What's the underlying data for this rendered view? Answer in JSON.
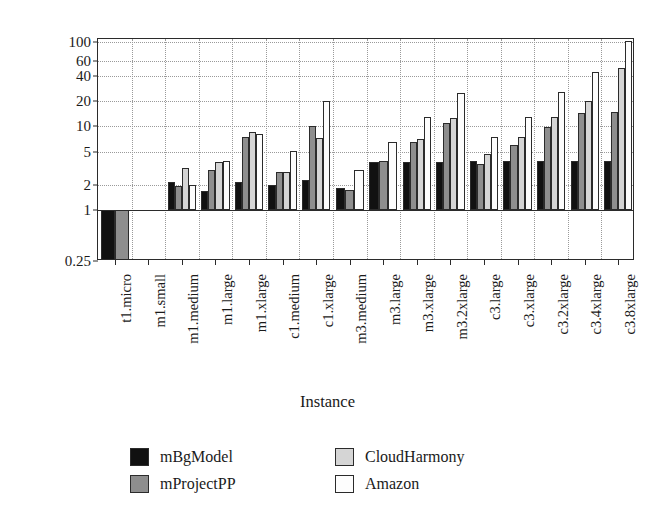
{
  "chart_data": {
    "type": "bar",
    "title": "",
    "xlabel": "Instance",
    "ylabel": "Relative performance",
    "yscale": "log",
    "ylim": [
      0.25,
      110
    ],
    "grid": true,
    "legend_position": "bottom",
    "ytick_labels": [
      "100",
      "60",
      "40",
      "20",
      "10",
      "5",
      "2",
      "1",
      "0.25"
    ],
    "ytick_values": [
      100,
      60,
      40,
      20,
      10,
      5,
      2,
      1,
      0.25
    ],
    "baseline": 1,
    "categories": [
      "t1.micro",
      "m1.small",
      "m1.medium",
      "m1.large",
      "m1.xlarge",
      "c1.medium",
      "c1.xlarge",
      "m3.medium",
      "m3.large",
      "m3.xlarge",
      "m3.2xlarge",
      "c3.large",
      "c3.xlarge",
      "c3.2xlarge",
      "c3.4xlarge",
      "c3.8xlarge"
    ],
    "series": [
      {
        "name": "mBgModel",
        "color": "#111111",
        "values": [
          0.25,
          null,
          2.2,
          1.7,
          2.2,
          2.0,
          2.3,
          1.85,
          3.8,
          3.8,
          3.8,
          3.9,
          3.9,
          3.9,
          3.9,
          3.9
        ]
      },
      {
        "name": "mProjectPP",
        "color": "#8e8e8e",
        "values": [
          0.25,
          null,
          1.95,
          3.0,
          7.5,
          2.9,
          10.2,
          1.75,
          3.9,
          6.5,
          11.0,
          3.6,
          6.0,
          9.8,
          14.5,
          15.0
        ]
      },
      {
        "name": "CloudHarmony",
        "color": "#d5d5d5",
        "values": [
          null,
          null,
          3.2,
          3.8,
          8.6,
          2.9,
          7.2,
          null,
          null,
          7.0,
          12.5,
          4.7,
          7.5,
          13.0,
          20.0,
          50.0
        ]
      },
      {
        "name": "Amazon",
        "color": "#fdfdfd",
        "values": [
          null,
          null,
          2.0,
          3.9,
          8.2,
          5.1,
          20.0,
          3.0,
          6.5,
          13.0,
          25.0,
          7.4,
          13.0,
          26.0,
          45.0,
          103.0
        ]
      }
    ]
  },
  "legend": {
    "entries": [
      {
        "label": "mBgModel",
        "color": "#111111"
      },
      {
        "label": "CloudHarmony",
        "color": "#d5d5d5"
      },
      {
        "label": "mProjectPP",
        "color": "#8e8e8e"
      },
      {
        "label": "Amazon",
        "color": "#fdfdfd"
      }
    ]
  }
}
